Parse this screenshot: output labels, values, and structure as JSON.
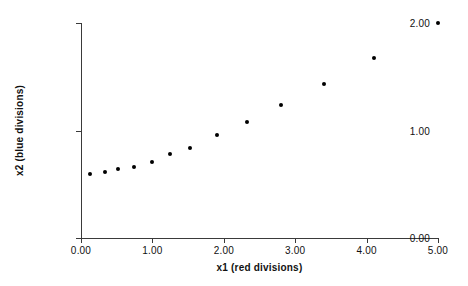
{
  "chart_data": {
    "type": "scatter",
    "title": "",
    "xlabel": "x1 (red divisions)",
    "ylabel": "x2 (blue divisions)",
    "xlim": [
      0.0,
      5.0
    ],
    "ylim": [
      0.0,
      2.0
    ],
    "grid": false,
    "legend": null,
    "xticks": [
      0.0,
      1.0,
      2.0,
      3.0,
      4.0,
      5.0
    ],
    "xtick_labels": [
      "0.00",
      "1.00",
      "2.00",
      "3.00",
      "4.00",
      "5.00"
    ],
    "yticks": [
      0.0,
      1.0,
      2.0
    ],
    "ytick_labels": [
      "0.00",
      "1.00",
      "2.00"
    ],
    "marker": "filled-circle",
    "marker_color": "#000000",
    "x": [
      0.13,
      0.33,
      0.52,
      0.74,
      1.0,
      1.25,
      1.53,
      1.9,
      2.32,
      2.8,
      3.4,
      4.1,
      5.0
    ],
    "y": [
      0.6,
      0.61,
      0.64,
      0.66,
      0.71,
      0.78,
      0.84,
      0.96,
      1.08,
      1.24,
      1.43,
      1.67,
      2.0
    ],
    "points": [
      {
        "x": 0.13,
        "y": 0.6
      },
      {
        "x": 0.33,
        "y": 0.61
      },
      {
        "x": 0.52,
        "y": 0.64
      },
      {
        "x": 0.74,
        "y": 0.66
      },
      {
        "x": 1.0,
        "y": 0.71
      },
      {
        "x": 1.25,
        "y": 0.78
      },
      {
        "x": 1.53,
        "y": 0.84
      },
      {
        "x": 1.9,
        "y": 0.96
      },
      {
        "x": 2.32,
        "y": 1.08
      },
      {
        "x": 2.8,
        "y": 1.24
      },
      {
        "x": 3.4,
        "y": 1.43
      },
      {
        "x": 4.1,
        "y": 1.67
      },
      {
        "x": 5.0,
        "y": 2.0
      }
    ]
  }
}
